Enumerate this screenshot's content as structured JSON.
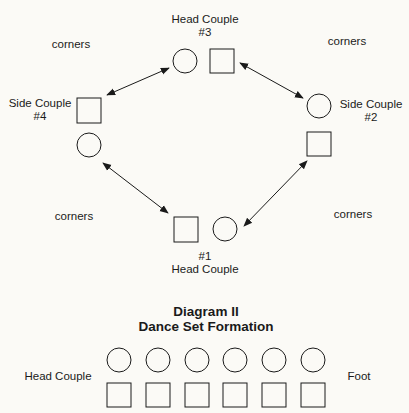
{
  "diagram_i": {
    "couples": {
      "head_3": {
        "label": "Head Couple",
        "number": "#3"
      },
      "side_2": {
        "label": "Side Couple",
        "number": "#2"
      },
      "side_4": {
        "label": "Side Couple",
        "number": "#4"
      },
      "head_1": {
        "label": "Head Couple",
        "number": "#1"
      }
    },
    "corners": [
      {
        "position": "top-left",
        "label": "corners"
      },
      {
        "position": "top-right",
        "label": "corners"
      },
      {
        "position": "bottom-left",
        "label": "corners"
      },
      {
        "position": "bottom-right",
        "label": "corners"
      }
    ],
    "legend": {
      "circle": "lady",
      "square": "gentleman"
    }
  },
  "diagram_ii": {
    "title": "Diagram II",
    "subtitle": "Dance Set Formation",
    "head_label": "Head Couple",
    "foot_label": "Foot",
    "couple_count": 6
  },
  "colors": {
    "background": "#fbfaf6",
    "ink": "#1a1a1a"
  }
}
